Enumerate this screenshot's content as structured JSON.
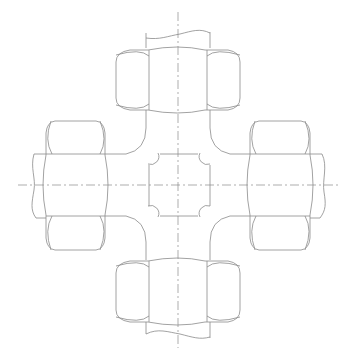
{
  "drawing": {
    "title": "Cross pipe fitting with four hex nuts (orthographic view)",
    "stroke_color": "#8a8a8a",
    "background": "#ffffff",
    "center": {
      "x": 178,
      "y": 185
    },
    "components": [
      {
        "name": "top-hex-nut",
        "position": "top"
      },
      {
        "name": "bottom-hex-nut",
        "position": "bottom"
      },
      {
        "name": "left-hex-nut",
        "position": "left"
      },
      {
        "name": "right-hex-nut",
        "position": "right"
      },
      {
        "name": "cross-body",
        "position": "center"
      },
      {
        "name": "pipe-stubs",
        "count": 4
      }
    ],
    "centerlines": [
      "vertical",
      "horizontal"
    ]
  }
}
